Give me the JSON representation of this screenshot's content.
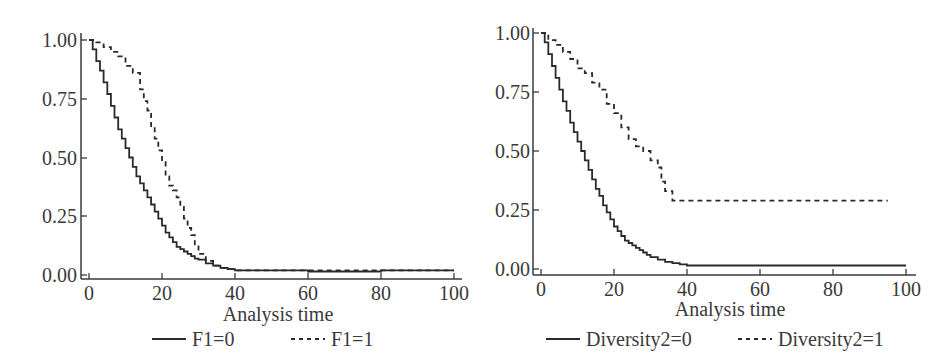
{
  "chart_data": [
    {
      "type": "line",
      "subtype": "step (Kaplan-Meier survival curve)",
      "title": "",
      "xlabel": "Analysis time",
      "ylabel": "",
      "xlim": [
        0,
        100
      ],
      "ylim": [
        0,
        1
      ],
      "xticks": [
        "0",
        "20",
        "40",
        "60",
        "80",
        "100"
      ],
      "yticks": [
        "0.00",
        "0.25",
        "0.50",
        "0.75",
        "1.00"
      ],
      "grid": false,
      "legend_position": "bottom",
      "series": [
        {
          "name": "F1=0",
          "style": "solid",
          "x": [
            0,
            1,
            2,
            3,
            4,
            5,
            6,
            7,
            8,
            9,
            10,
            11,
            12,
            13,
            14,
            15,
            16,
            17,
            18,
            19,
            20,
            21,
            22,
            23,
            24,
            25,
            26,
            27,
            28,
            29,
            30,
            32,
            34,
            36,
            38,
            40,
            50,
            60,
            70,
            80,
            90,
            100
          ],
          "values": [
            1.0,
            0.96,
            0.91,
            0.87,
            0.82,
            0.77,
            0.72,
            0.67,
            0.62,
            0.58,
            0.54,
            0.5,
            0.46,
            0.42,
            0.39,
            0.36,
            0.33,
            0.3,
            0.27,
            0.24,
            0.21,
            0.18,
            0.16,
            0.14,
            0.12,
            0.11,
            0.1,
            0.09,
            0.08,
            0.07,
            0.065,
            0.05,
            0.04,
            0.03,
            0.025,
            0.02,
            0.02,
            0.015,
            0.015,
            0.02,
            0.02,
            0.02
          ]
        },
        {
          "name": "F1=1",
          "style": "dashed",
          "x": [
            0,
            2,
            4,
            6,
            8,
            10,
            12,
            14,
            15,
            16,
            17,
            18,
            19,
            20,
            21,
            22,
            23,
            24,
            25,
            26,
            27,
            28,
            29,
            30,
            32,
            34,
            36,
            38,
            40,
            50,
            60,
            70,
            80,
            90,
            100
          ],
          "values": [
            1.0,
            0.99,
            0.97,
            0.95,
            0.93,
            0.89,
            0.86,
            0.79,
            0.74,
            0.7,
            0.63,
            0.58,
            0.53,
            0.48,
            0.42,
            0.38,
            0.36,
            0.33,
            0.29,
            0.24,
            0.2,
            0.17,
            0.13,
            0.09,
            0.06,
            0.04,
            0.03,
            0.025,
            0.02,
            0.02,
            0.02,
            0.02,
            0.02,
            0.02,
            0.02
          ]
        }
      ]
    },
    {
      "type": "line",
      "subtype": "step (Kaplan-Meier survival curve)",
      "title": "",
      "xlabel": "Analysis time",
      "ylabel": "",
      "xlim": [
        0,
        100
      ],
      "ylim": [
        0,
        1
      ],
      "xticks": [
        "0",
        "20",
        "40",
        "60",
        "80",
        "100"
      ],
      "yticks": [
        "0.00",
        "0.25",
        "0.50",
        "0.75",
        "1.00"
      ],
      "grid": false,
      "legend_position": "bottom",
      "series": [
        {
          "name": "Diversity2=0",
          "style": "solid",
          "x": [
            0,
            1,
            2,
            3,
            4,
            5,
            6,
            7,
            8,
            9,
            10,
            11,
            12,
            13,
            14,
            15,
            16,
            17,
            18,
            19,
            20,
            21,
            22,
            23,
            24,
            25,
            26,
            27,
            28,
            29,
            30,
            32,
            34,
            36,
            38,
            40,
            50,
            60,
            70,
            80,
            90,
            100
          ],
          "values": [
            1.0,
            0.96,
            0.91,
            0.86,
            0.81,
            0.76,
            0.71,
            0.67,
            0.62,
            0.58,
            0.54,
            0.5,
            0.46,
            0.42,
            0.38,
            0.34,
            0.31,
            0.27,
            0.24,
            0.21,
            0.18,
            0.16,
            0.14,
            0.12,
            0.11,
            0.1,
            0.09,
            0.08,
            0.07,
            0.06,
            0.05,
            0.04,
            0.03,
            0.025,
            0.02,
            0.015,
            0.015,
            0.015,
            0.015,
            0.015,
            0.015,
            0.015
          ]
        },
        {
          "name": "Diversity2=1",
          "style": "dashed",
          "x": [
            0,
            2,
            4,
            6,
            8,
            10,
            12,
            14,
            16,
            18,
            20,
            22,
            24,
            26,
            28,
            30,
            32,
            33,
            34,
            36,
            40,
            50,
            60,
            70,
            80,
            90,
            95
          ],
          "values": [
            1.0,
            0.97,
            0.95,
            0.92,
            0.89,
            0.85,
            0.83,
            0.79,
            0.76,
            0.7,
            0.66,
            0.6,
            0.55,
            0.52,
            0.5,
            0.46,
            0.43,
            0.37,
            0.33,
            0.29,
            0.29,
            0.29,
            0.29,
            0.29,
            0.29,
            0.29,
            0.29
          ]
        }
      ]
    }
  ],
  "panels": [
    {
      "xlabel": "Analysis time",
      "xticks": [
        "0",
        "20",
        "40",
        "60",
        "80",
        "100"
      ],
      "yticks": [
        "0.00",
        "0.25",
        "0.50",
        "0.75",
        "1.00"
      ],
      "legend": [
        {
          "label": "F1=0",
          "style": "solid"
        },
        {
          "label": "F1=1",
          "style": "dashed"
        }
      ]
    },
    {
      "xlabel": "Analysis time",
      "xticks": [
        "0",
        "20",
        "40",
        "60",
        "80",
        "100"
      ],
      "yticks": [
        "0.00",
        "0.25",
        "0.50",
        "0.75",
        "1.00"
      ],
      "legend": [
        {
          "label": "Diversity2=0",
          "style": "solid"
        },
        {
          "label": "Diversity2=1",
          "style": "dashed"
        }
      ]
    }
  ],
  "colors": {
    "line": "#2a2a2a",
    "axis": "#3a3a3a",
    "text": "#3a3a3a",
    "background": "#ffffff"
  }
}
